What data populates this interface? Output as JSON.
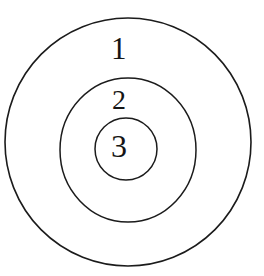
{
  "diagram": {
    "type": "concentric-circles",
    "background_color": "#ffffff",
    "stroke_color": "#1b1b1b",
    "text_color": "#151515",
    "rings": [
      {
        "id": "outer",
        "label": "1",
        "center_x": 128,
        "center_y": 142,
        "radius_x": 123,
        "radius_y": 124,
        "stroke_width": 1.6
      },
      {
        "id": "middle",
        "label": "2",
        "center_x": 128,
        "center_y": 150,
        "radius_x": 68,
        "radius_y": 72,
        "stroke_width": 1.5
      },
      {
        "id": "inner",
        "label": "3",
        "center_x": 126,
        "center_y": 149,
        "radius_x": 31,
        "radius_y": 31,
        "stroke_width": 1.5
      }
    ]
  }
}
